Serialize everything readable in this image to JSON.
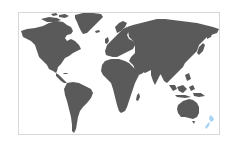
{
  "map": {
    "type": "world-map",
    "land_color": "#5a5a5a",
    "highlight_color": "#a9d3f2",
    "background_color": "#ffffff",
    "border_color": "#d8d8d8",
    "highlighted_regions": [
      "New Zealand"
    ],
    "regions": [
      {
        "name": "North America",
        "highlighted": false
      },
      {
        "name": "Greenland",
        "highlighted": false
      },
      {
        "name": "South America",
        "highlighted": false
      },
      {
        "name": "Europe",
        "highlighted": false
      },
      {
        "name": "Africa",
        "highlighted": false
      },
      {
        "name": "Asia",
        "highlighted": false
      },
      {
        "name": "Southeast Asia",
        "highlighted": false
      },
      {
        "name": "Australia",
        "highlighted": false
      },
      {
        "name": "New Zealand",
        "highlighted": true
      }
    ]
  }
}
